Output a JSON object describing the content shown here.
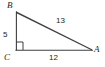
{
  "figure": {
    "kind": "geometry-diagram",
    "shape_name": "right-triangle",
    "background_color": "#ffffff",
    "stroke_color": "#3f3f41",
    "text_color": "#231f20",
    "vertices": [
      {
        "id": "B",
        "label": "B",
        "x": 16,
        "y": 12
      },
      {
        "id": "C",
        "label": "C",
        "x": 16,
        "y": 50
      },
      {
        "id": "A",
        "label": "A",
        "x": 92,
        "y": 50
      }
    ],
    "sides": [
      {
        "id": "BC",
        "label": "5",
        "from": "B",
        "to": "C",
        "role": "vertical-leg"
      },
      {
        "id": "BA",
        "label": "13",
        "from": "B",
        "to": "A",
        "role": "hypotenuse"
      },
      {
        "id": "CA",
        "label": "12",
        "from": "C",
        "to": "A",
        "role": "horizontal-leg"
      }
    ],
    "right_angle": {
      "at_vertex": "C",
      "marker": "square",
      "size": 8
    }
  }
}
